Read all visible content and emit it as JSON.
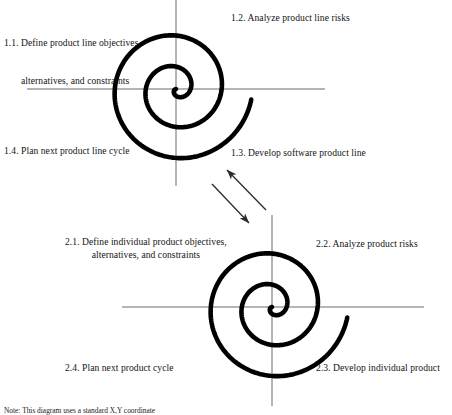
{
  "figure": {
    "type": "spiral-model-diagram",
    "title_text": "",
    "background": "#ffffff",
    "spiral_color": "#000000",
    "axis_color": "#6b6b6b",
    "arrow_color": "#2b2b2b"
  },
  "spirals": [
    {
      "id": "product-line-spiral",
      "center": {
        "x": 176,
        "y": 89
      },
      "axis_h": {
        "x1": 27,
        "x2": 325,
        "y": 89
      },
      "axis_v": {
        "y1": 0,
        "y2": 186,
        "x": 176
      },
      "turns": 2.45,
      "max_radius": 76,
      "stroke_width": 4.6,
      "start_angle_deg": 170
    },
    {
      "id": "individual-product-spiral",
      "center": {
        "x": 272,
        "y": 307
      },
      "axis_h": {
        "x1": 122,
        "x2": 424,
        "y": 307
      },
      "axis_v": {
        "y1": 215,
        "y2": 406,
        "x": 272
      },
      "turns": 2.45,
      "max_radius": 76,
      "stroke_width": 4.6,
      "start_angle_deg": 170
    }
  ],
  "connector_arrows": [
    {
      "id": "arrow-up-left",
      "from": {
        "x": 266,
        "y": 210
      },
      "to": {
        "x": 227,
        "y": 170
      },
      "direction": "up-left"
    },
    {
      "id": "arrow-down-right",
      "from": {
        "x": 212,
        "y": 184
      },
      "to": {
        "x": 249,
        "y": 223
      },
      "direction": "down-right"
    }
  ],
  "labels": {
    "q1_1": {
      "id": "label-1-1",
      "lines": [
        "1.1. Define product line objectives,",
        "alternatives, and constraints"
      ],
      "line1": "1.1. Define product line objectives,",
      "line2": "alternatives, and constraints",
      "x": 4,
      "y": 12
    },
    "q1_2": {
      "id": "label-1-2",
      "text": "1.2. Analyze product line risks",
      "x": 231,
      "y": 12
    },
    "q1_3": {
      "id": "label-1-3",
      "text": "1.3. Develop software product line",
      "x": 231,
      "y": 147
    },
    "q1_4": {
      "id": "label-1-4",
      "text": "1.4. Plan next product line cycle",
      "x": 4,
      "y": 145
    },
    "q2_1": {
      "id": "label-2-1",
      "lines": [
        "2.1. Define individual product objectives,",
        "alternatives, and constraints"
      ],
      "line1": "2.1. Define individual product objectives,",
      "line2": "alternatives, and constraints",
      "x": 65,
      "y": 236
    },
    "q2_2": {
      "id": "label-2-2",
      "text": "2.2. Analyze product risks",
      "x": 316,
      "y": 238
    },
    "q2_3": {
      "id": "label-2-3",
      "text": "2.3. Develop individual product",
      "x": 316,
      "y": 362
    },
    "q2_4": {
      "id": "label-2-4",
      "text": "2.4. Plan next product cycle",
      "x": 65,
      "y": 362
    }
  },
  "footnote": {
    "id": "figure-note",
    "text": "Note: This diagram uses a standard X,Y coordinate",
    "x": 4,
    "y": 406
  }
}
